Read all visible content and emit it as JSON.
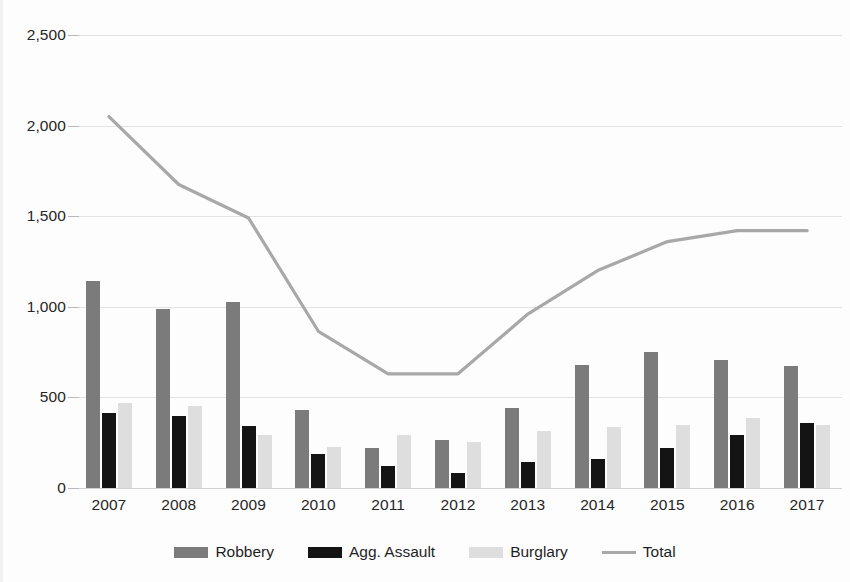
{
  "chart_data": {
    "type": "bar",
    "title": "",
    "subtitle": "",
    "xlabel": "",
    "ylabel": "",
    "categories": [
      "2007",
      "2008",
      "2009",
      "2010",
      "2011",
      "2012",
      "2013",
      "2014",
      "2015",
      "2016",
      "2017"
    ],
    "ylim": [
      0,
      2500
    ],
    "ytick_values": [
      0,
      500,
      1000,
      1500,
      2000,
      2500
    ],
    "ytick_labels": [
      "0",
      "500",
      "1,000",
      "1,500",
      "2,000",
      "2,500"
    ],
    "grid": true,
    "legend_position": "bottom",
    "series": [
      {
        "name": "Robbery",
        "type": "bar",
        "color": "#7b7b7b",
        "values": [
          1140,
          990,
          1025,
          430,
          220,
          265,
          440,
          680,
          750,
          705,
          675
        ]
      },
      {
        "name": "Agg. Assault",
        "type": "bar",
        "color": "#141414",
        "values": [
          415,
          395,
          340,
          190,
          120,
          85,
          145,
          160,
          220,
          295,
          360
        ]
      },
      {
        "name": "Burglary",
        "type": "bar",
        "color": "#dedede",
        "values": [
          470,
          455,
          295,
          225,
          290,
          255,
          315,
          335,
          350,
          385,
          350
        ]
      },
      {
        "name": "Total",
        "type": "line",
        "color": "#a8a8a8",
        "values": [
          2050,
          1675,
          1490,
          865,
          630,
          630,
          960,
          1200,
          1360,
          1420,
          1420
        ]
      }
    ]
  },
  "legend": {
    "items": [
      {
        "label": "Robbery",
        "icon": "square-swatch-icon",
        "color": "#7b7b7b"
      },
      {
        "label": "Agg. Assault",
        "icon": "square-swatch-icon",
        "color": "#141414"
      },
      {
        "label": "Burglary",
        "icon": "square-swatch-icon",
        "color": "#dedede"
      },
      {
        "label": "Total",
        "icon": "line-swatch-icon",
        "color": "#a8a8a8"
      }
    ]
  },
  "axes": {
    "y_labels": [
      "2,500",
      "2,000",
      "1,500",
      "1,000",
      "500",
      "0"
    ],
    "x_labels": [
      "2007",
      "2008",
      "2009",
      "2010",
      "2011",
      "2012",
      "2013",
      "2014",
      "2015",
      "2016",
      "2017"
    ]
  }
}
